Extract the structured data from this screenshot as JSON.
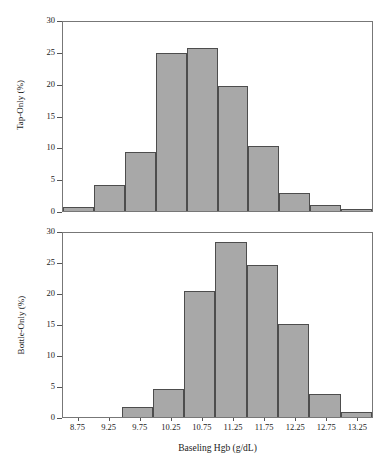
{
  "chart_data": {
    "type": "bar",
    "title": "",
    "subtitle": "",
    "xlabel": "Baseling Hgb (g/dL)",
    "categories": [
      "8.75",
      "9.25",
      "9.75",
      "10.25",
      "10.75",
      "11.25",
      "11.75",
      "12.25",
      "12.75",
      "13.25"
    ],
    "xlim": [
      8.5,
      13.5
    ],
    "ylim": [
      0,
      30
    ],
    "yticks": [
      0,
      5,
      10,
      15,
      20,
      25,
      30
    ],
    "grid": false,
    "legend": "none",
    "bar_fill_color": "#a8a8a8",
    "bar_edge_color": "#4d4d4d",
    "axis_color": "#777777",
    "panels": [
      {
        "id": "tap-only",
        "ylabel": "Tap-Only (%)",
        "values": [
          0.6,
          4.1,
          9.4,
          25.1,
          25.9,
          19.9,
          10.3,
          2.8,
          0.9,
          0.3
        ]
      },
      {
        "id": "bottle-only",
        "ylabel": "Bottle-Only (%)",
        "values": [
          0.0,
          0.0,
          1.6,
          4.5,
          20.5,
          28.5,
          24.8,
          15.2,
          3.8,
          0.8
        ]
      }
    ]
  }
}
